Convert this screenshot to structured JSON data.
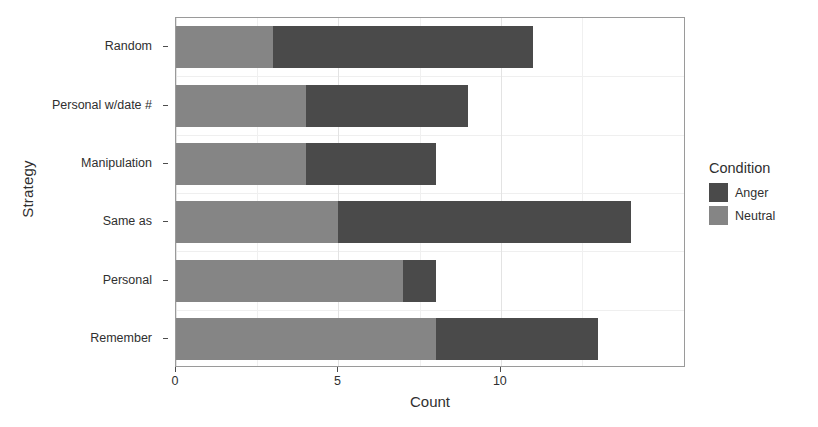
{
  "chart_data": {
    "type": "bar",
    "orientation": "horizontal",
    "stacked": true,
    "title": "",
    "xlabel": "Count",
    "ylabel": "Strategy",
    "categories": [
      "Remember",
      "Personal",
      "Same as",
      "Manipulation",
      "Personal w/date #",
      "Random"
    ],
    "categories_top_to_bottom": [
      "Random",
      "Personal w/date #",
      "Manipulation",
      "Same as",
      "Personal",
      "Remember"
    ],
    "series": [
      {
        "name": "Neutral",
        "color": "#858585",
        "values_top_to_bottom": [
          3,
          4,
          4,
          5,
          7,
          8
        ]
      },
      {
        "name": "Anger",
        "color": "#4a4a4a",
        "values_top_to_bottom": [
          8,
          5,
          4,
          9,
          1,
          5
        ]
      }
    ],
    "totals_top_to_bottom": [
      11,
      9,
      8,
      14,
      8,
      13
    ],
    "stack_order_left_to_right": [
      "Neutral",
      "Anger"
    ],
    "xlim": [
      0,
      15.7
    ],
    "xticks": [
      0,
      5,
      10
    ],
    "xtick_labels": [
      "0",
      "5",
      "10"
    ],
    "x_minor_ticks": [
      2.5,
      7.5,
      12.5
    ],
    "grid": true,
    "legend_position": "right"
  },
  "legend": {
    "title": "Condition",
    "entries": [
      {
        "label": "Anger",
        "color": "#4a4a4a"
      },
      {
        "label": "Neutral",
        "color": "#858585"
      }
    ]
  },
  "axes": {
    "x_title": "Count",
    "y_title": "Strategy",
    "x_tick_labels": [
      "0",
      "5",
      "10"
    ],
    "y_tick_labels": [
      "Random",
      "Personal w/date #",
      "Manipulation",
      "Same as",
      "Personal",
      "Remember"
    ]
  }
}
